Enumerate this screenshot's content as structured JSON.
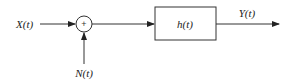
{
  "diagram": {
    "type": "block-diagram",
    "input_label": "X(t)",
    "noise_label": "N(t)",
    "summer_symbol": "+",
    "filter_label": "h(t)",
    "output_label": "Y(t)",
    "colors": {
      "stroke": "#333333",
      "background": "#ffffff"
    }
  }
}
